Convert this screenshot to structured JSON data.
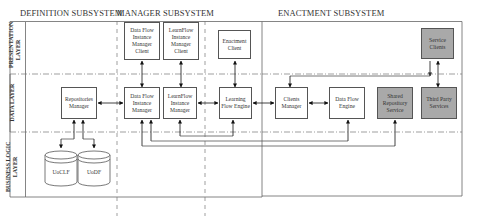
{
  "headers": {
    "definition": "DEFINITION SUBSYSTEM",
    "manager": "MANAGER SUBSYSTEM",
    "enactment": "ENACTMENT SUBSYSTEM"
  },
  "layers": {
    "presentation": [
      "PRESENTATION",
      "LAYER"
    ],
    "data": "DATA LAYER",
    "business": [
      "BUSINESS LOGIC",
      "LAYER"
    ]
  },
  "boxes": {
    "dataflow_client": "Data Flow Instance Manager Client",
    "learnflow_client": "LearnFlow Instance Manager Client",
    "enactment_client": "Enactment Client",
    "service_clients": "Service Clients",
    "repositories_manager": "Repositories Manager",
    "dataflow_instance_manager": "Data Flow Instance Manager",
    "learnflow_instance_manager": "LearnFlow Instance Manager",
    "learning_flow_engine": "Learning Flow Engine",
    "clients_manager": "Clients Manager",
    "dataflow_engine": "Data Flow Engine",
    "shared_repository_service": "Shared Repository Service",
    "third_party_services": "Third Party Services"
  },
  "databases": {
    "uoclf": "UoCLF",
    "uodf": "UoDF"
  },
  "colors": {
    "gray_box": "#a9a9a9",
    "line": "#555555"
  }
}
